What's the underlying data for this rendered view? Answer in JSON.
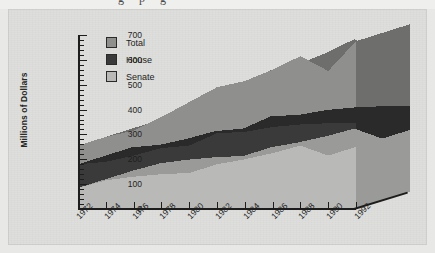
{
  "page": {
    "bleed_text": "g   p   g"
  },
  "chart_data": {
    "type": "area",
    "title": "",
    "subtitle": "",
    "xlabel": "",
    "ylabel": "Millions of Dollars",
    "ylim": [
      0,
      700
    ],
    "ytick_step": 100,
    "yticks": [
      "0",
      "100",
      "200",
      "300",
      "400",
      "500",
      "600",
      "700"
    ],
    "minor_ticks_per_interval": 5,
    "grid": false,
    "legend_position": "top-left",
    "stacked": true,
    "three_d": true,
    "categories": [
      "1972",
      "1974",
      "1976",
      "1978",
      "1980",
      "1982",
      "1984",
      "1986",
      "1988",
      "1990",
      "1992"
    ],
    "x": [
      1972,
      1974,
      1976,
      1978,
      1980,
      1982,
      1984,
      1986,
      1988,
      1990,
      1992
    ],
    "series": [
      {
        "name": "Senate",
        "color": "#b9b9b7",
        "values": [
          85,
          115,
          130,
          140,
          145,
          180,
          200,
          225,
          255,
          215,
          250
        ]
      },
      {
        "name": "House",
        "color": "#3a3a3a",
        "values": [
          95,
          75,
          85,
          105,
          110,
          125,
          110,
          105,
          85,
          130,
          95
        ]
      },
      {
        "name": "Total",
        "color": "#8f8f8d",
        "values": [
          180,
          190,
          215,
          255,
          300,
          325,
          330,
          345,
          360,
          350,
          675
        ]
      }
    ],
    "cumulative_tops": {
      "senate": [
        85,
        115,
        130,
        140,
        145,
        180,
        200,
        225,
        255,
        215,
        250
      ],
      "house": [
        180,
        190,
        215,
        245,
        255,
        305,
        310,
        330,
        340,
        345,
        345
      ],
      "total": [
        255,
        290,
        315,
        370,
        430,
        490,
        515,
        560,
        615,
        555,
        675
      ]
    }
  },
  "legend": {
    "items": [
      {
        "label": "Total",
        "color": "#8f8f8d"
      },
      {
        "label": "House",
        "color": "#3a3a3a"
      },
      {
        "label": "Senate",
        "color": "#b9b9b7"
      }
    ]
  },
  "colors": {
    "background": "#dededc",
    "axis": "#1d1d1d",
    "text": "#1f1f1f",
    "total_face": "#8f8f8d",
    "total_side": "#6e6e6c",
    "house_face": "#3a3a3a",
    "house_side": "#2a2a2a",
    "senate_face": "#b9b9b7",
    "senate_side": "#9a9a98"
  }
}
